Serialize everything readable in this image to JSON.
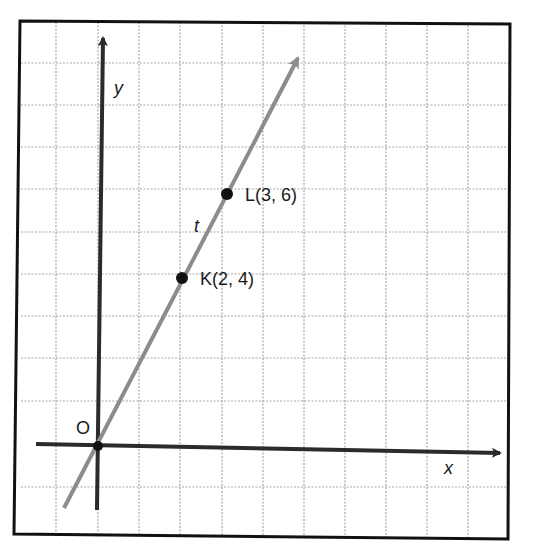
{
  "diagram": {
    "type": "coordinate-plane",
    "axes": {
      "x_label": "x",
      "y_label": "y",
      "origin_label": "O"
    },
    "line": {
      "label": "t",
      "color": "#8c8c8c"
    },
    "points": [
      {
        "name": "K",
        "x": 2,
        "y": 4,
        "label": "K(2, 4)"
      },
      {
        "name": "L",
        "x": 3,
        "y": 6,
        "label": "L(3, 6)"
      }
    ],
    "colors": {
      "axis": "#2b2b2b",
      "grid": "#a8a8a8",
      "border": "#111111",
      "point": "#111111"
    }
  }
}
